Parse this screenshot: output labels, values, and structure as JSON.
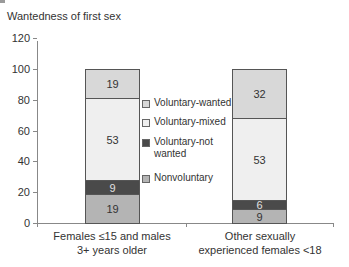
{
  "chart_data": {
    "type": "bar",
    "stacked": true,
    "title": "Wantedness of first sex",
    "xlabel": "",
    "ylabel": "",
    "ylim": [
      0,
      120
    ],
    "yticks": [
      0,
      20,
      40,
      60,
      80,
      100,
      120
    ],
    "grid": false,
    "legend_position": "center",
    "categories": [
      "Females ≤15 and males 3+ years older",
      "Other sexually experienced females <18"
    ],
    "category_lines": [
      [
        "Females ≤15 and males",
        "3+ years older"
      ],
      [
        "Other sexually",
        "experienced females <18"
      ]
    ],
    "series": [
      {
        "name": "Nonvoluntary",
        "values": [
          19,
          9
        ],
        "color": "#b4b4b4"
      },
      {
        "name": "Voluntary-not wanted",
        "values": [
          9,
          6
        ],
        "color": "#4a4a4a"
      },
      {
        "name": "Voluntary-mixed",
        "values": [
          53,
          53
        ],
        "color": "#efefef"
      },
      {
        "name": "Voluntary-wanted",
        "values": [
          19,
          32
        ],
        "color": "#d8d8d8"
      }
    ],
    "legend": [
      {
        "label": "Voluntary-wanted",
        "color": "#d8d8d8"
      },
      {
        "label": "Voluntary-mixed",
        "color": "#efefef"
      },
      {
        "label": "Voluntary-not wanted",
        "lines": [
          "Voluntary-not",
          "wanted"
        ],
        "color": "#4a4a4a"
      },
      {
        "label": "Nonvoluntary",
        "color": "#b4b4b4"
      }
    ]
  }
}
